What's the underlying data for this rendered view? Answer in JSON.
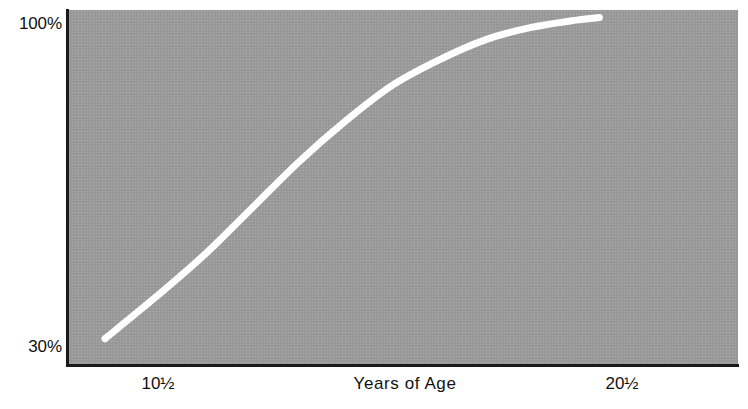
{
  "chart_data": {
    "type": "line",
    "title": "",
    "subtitle": "",
    "xlabel": "Years of Age",
    "ylabel": "",
    "xlim": [
      8.5,
      23.0
    ],
    "ylim": [
      30,
      100
    ],
    "grid": false,
    "legend": null,
    "y_tick_labels": [
      "100%",
      "30%"
    ],
    "y_ticks": [
      100,
      30
    ],
    "x_tick_labels": [
      "10½",
      "20½"
    ],
    "x_ticks": [
      10.5,
      20.5
    ],
    "annotations": [],
    "series": [
      {
        "name": "Percent of adult value",
        "color": "#ffffff",
        "line_width_px": 7,
        "x": [
          9.3,
          10.5,
          11.5,
          12.5,
          13.5,
          14.5,
          15.5,
          16.5,
          17.5,
          18.5,
          19.5,
          20.0
        ],
        "values": [
          35,
          44,
          52,
          61,
          70,
          78,
          85,
          90,
          94,
          96.5,
          98,
          98.5
        ]
      }
    ]
  },
  "axes": {
    "y": {
      "top_label": "100%",
      "bottom_label": "30%"
    },
    "x": {
      "left_tick": "10½",
      "title": "Years of Age",
      "right_tick": "20½"
    }
  },
  "style": {
    "panel_color": "#9b9b9b",
    "curve_color": "#ffffff",
    "axis_color": "#1a1a1a",
    "text_color": "#111111",
    "background_color": "#ffffff"
  }
}
